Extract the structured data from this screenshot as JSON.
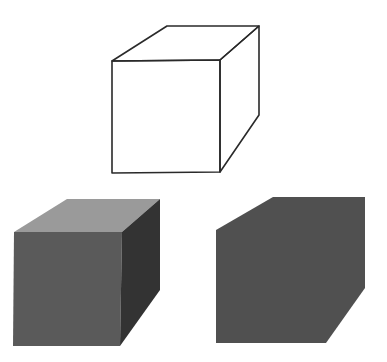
{
  "figure": {
    "background": "#ffffff",
    "wireframe_cube": {
      "stroke": "#2a2a2a",
      "stroke_width": 1.6,
      "front": "112,61 220,60 220,172 112,173",
      "top": "112,61 167,26 259,26 220,60",
      "side": "220,60 259,26 259,115 220,172"
    },
    "shaded_cube": {
      "top_color": "#9a9a9a",
      "front_color": "#5a5a5a",
      "side_color": "#333333",
      "top": "14,232 67,199 160,199 122,232",
      "front": "14,232 122,232 120,346 13,346",
      "side": "122,232 160,199 160,290 120,346"
    },
    "silhouette_cube": {
      "color": "#505050",
      "outline": "216,230 273,197 365,197 365,288 326,343 216,343"
    }
  }
}
